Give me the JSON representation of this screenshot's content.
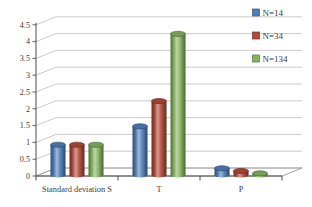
{
  "chart_data": {
    "type": "bar",
    "variant": "3d-cylinder",
    "title": "",
    "xlabel": "",
    "ylabel": "",
    "categories": [
      "Standard deviation S",
      "T",
      "P"
    ],
    "series": [
      {
        "name": "N=14",
        "color": "#4E7FBB",
        "values": [
          0.9,
          1.45,
          0.2
        ]
      },
      {
        "name": "N=34",
        "color": "#B34A38",
        "values": [
          0.9,
          2.2,
          0.12
        ]
      },
      {
        "name": "N=134",
        "color": "#86B45F",
        "values": [
          0.9,
          4.2,
          0.05
        ]
      }
    ],
    "y_axis": {
      "min": 0,
      "max": 4.5,
      "step": 0.5,
      "tick_labels": [
        "0",
        "0.5",
        "1",
        "1.5",
        "2",
        "2.5",
        "3",
        "3.5",
        "4",
        "4.5"
      ]
    },
    "legend": {
      "position": "top-right",
      "entries": [
        "N=14",
        "N=34",
        "N=134"
      ]
    },
    "grid": true,
    "colors": {
      "background": "#FFFFFF",
      "gridline": "#BCBCBC",
      "axis": "#4D4D4D",
      "floor_edge": "#9A9A9A",
      "text": "#3D3D3D"
    }
  }
}
